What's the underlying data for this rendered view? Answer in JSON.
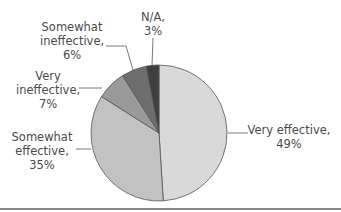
{
  "chart_data": {
    "type": "pie",
    "title": "",
    "start_angle": "12 o'clock",
    "slices": [
      {
        "label": "Very effective",
        "value": 49,
        "display": "49%",
        "color": "#d9d9d9"
      },
      {
        "label": "Somewhat effective",
        "value": 35,
        "display": "35%",
        "color": "#c2c2c2"
      },
      {
        "label": "Very ineffective",
        "value": 7,
        "display": "7%",
        "color": "#9a9a9a"
      },
      {
        "label": "Somewhat ineffective",
        "value": 6,
        "display": "6%",
        "color": "#6e6e6e"
      },
      {
        "label": "N/A",
        "value": 3,
        "display": "3%",
        "color": "#3f3f3f"
      }
    ],
    "legend": "none (direct labels with leader lines)"
  },
  "labels": {
    "very_effective": {
      "line1": "Very effective,",
      "line2": "49%"
    },
    "somewhat_effective": {
      "line1": "Somewhat",
      "line2": "effective,",
      "line3": "35%"
    },
    "very_ineffective": {
      "line1": "Very",
      "line2": "ineffective,",
      "line3": "7%"
    },
    "somewhat_ineffective": {
      "line1": "Somewhat",
      "line2": "ineffective,",
      "line3": "6%"
    },
    "na": {
      "line1": "N/A,",
      "line2": "3%"
    }
  }
}
